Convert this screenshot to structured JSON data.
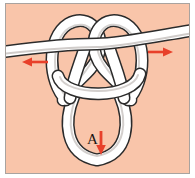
{
  "figure": {
    "background_color": "#f9c5aa",
    "frame_border_color": "#a9a39f",
    "page_color": "#ffffff",
    "rope": {
      "fill_color": "#ffffff",
      "outline_color": "#2b2b2b",
      "shade_color": "#c9c5c2",
      "width_px": 11
    }
  },
  "annotations": {
    "loop_label": "A",
    "arrow_color": "#e8402a",
    "arrows": [
      {
        "name": "left-pull-arrow",
        "direction": "left"
      },
      {
        "name": "right-pull-arrow",
        "direction": "right"
      },
      {
        "name": "loop-down-arrow",
        "direction": "down"
      }
    ]
  }
}
